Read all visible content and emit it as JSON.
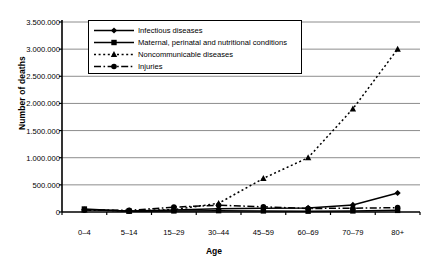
{
  "chart_data": {
    "type": "line",
    "title": "",
    "xlabel": "Age",
    "ylabel": "Number of deaths",
    "categories": [
      "0–4",
      "5–14",
      "15–29",
      "30–44",
      "45–59",
      "60–69",
      "70–79",
      "80+"
    ],
    "ylim": [
      0,
      3500000
    ],
    "ytick_labels": [
      "0",
      "500.000",
      "1.000.000",
      "1.500.000",
      "2.000.000",
      "2.500.000",
      "3.000.000",
      "3.500.000"
    ],
    "ytick_values": [
      0,
      500000,
      1000000,
      1500000,
      2000000,
      2500000,
      3000000,
      3500000
    ],
    "grid": true,
    "legend_position": "top-center",
    "series": [
      {
        "name": "Infectious diseases",
        "marker": "diamond",
        "line_style": "solid",
        "color": "#000000",
        "values": [
          40000,
          20000,
          35000,
          60000,
          70000,
          75000,
          130000,
          350000
        ]
      },
      {
        "name": "Maternal, perinatal and nutritional conditions",
        "marker": "square",
        "line_style": "solid",
        "color": "#000000",
        "values": [
          55000,
          15000,
          20000,
          25000,
          20000,
          15000,
          20000,
          30000
        ]
      },
      {
        "name": "Noncommunicable diseases",
        "marker": "triangle",
        "line_style": "dotted",
        "color": "#000000",
        "values": [
          40000,
          20000,
          45000,
          160000,
          620000,
          1000000,
          1900000,
          3000000
        ]
      },
      {
        "name": "Injuries",
        "marker": "circle",
        "line_style": "dashdot",
        "color": "#000000",
        "values": [
          35000,
          30000,
          90000,
          125000,
          95000,
          65000,
          70000,
          80000
        ]
      }
    ]
  }
}
